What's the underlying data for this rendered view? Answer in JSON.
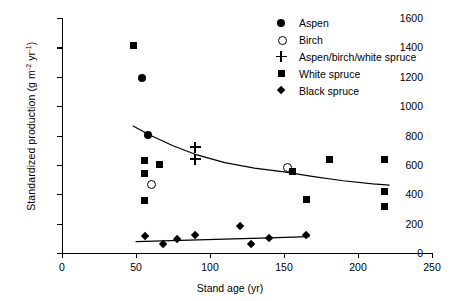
{
  "chart_data": {
    "type": "scatter",
    "title": "",
    "xlabel": "Stand age (yr)",
    "ylabel": "Standardized production (g m-2 yr-1)",
    "ylabel_parts": {
      "main": "Standardized production (g  m",
      "sup1": "-2",
      "mid": " yr",
      "sup2": "-1",
      "tail": ")"
    },
    "xlim": [
      0,
      250
    ],
    "ylim": [
      0,
      1600
    ],
    "xticks": [
      0,
      50,
      100,
      150,
      200,
      250
    ],
    "yticks": [
      0,
      200,
      400,
      600,
      800,
      1000,
      1200,
      1400,
      1600
    ],
    "grid": false,
    "legend_position": "top-right",
    "series": [
      {
        "name": "Aspen",
        "marker": "filled-circle",
        "points": [
          [
            54,
            1190
          ],
          [
            58,
            805
          ]
        ]
      },
      {
        "name": "Birch",
        "marker": "open-circle",
        "points": [
          [
            60,
            475
          ],
          [
            152,
            590
          ]
        ]
      },
      {
        "name": "Aspen/birch/white spruce",
        "marker": "plus",
        "points": [
          [
            90,
            720
          ],
          [
            90,
            640
          ]
        ]
      },
      {
        "name": "White spruce",
        "marker": "filled-square",
        "points": [
          [
            48,
            1415
          ],
          [
            56,
            630
          ],
          [
            56,
            540
          ],
          [
            56,
            355
          ],
          [
            66,
            600
          ],
          [
            156,
            555
          ],
          [
            165,
            365
          ],
          [
            181,
            635
          ],
          [
            218,
            640
          ],
          [
            218,
            420
          ],
          [
            218,
            315
          ]
        ]
      },
      {
        "name": "Black spruce",
        "marker": "filled-diamond",
        "points": [
          [
            56,
            115
          ],
          [
            68,
            60
          ],
          [
            78,
            95
          ],
          [
            90,
            125
          ],
          [
            120,
            185
          ],
          [
            128,
            60
          ],
          [
            140,
            100
          ],
          [
            165,
            120
          ]
        ]
      }
    ],
    "trend_lines": [
      {
        "name": "upper-trend",
        "points": [
          [
            48,
            865
          ],
          [
            60,
            800
          ],
          [
            75,
            730
          ],
          [
            90,
            672
          ],
          [
            110,
            615
          ],
          [
            130,
            578
          ],
          [
            150,
            552
          ],
          [
            170,
            520
          ],
          [
            190,
            492
          ],
          [
            210,
            470
          ],
          [
            221,
            462
          ]
        ]
      },
      {
        "name": "lower-trend",
        "points": [
          [
            50,
            78
          ],
          [
            80,
            86
          ],
          [
            110,
            94
          ],
          [
            140,
            103
          ],
          [
            167,
            112
          ]
        ]
      }
    ]
  },
  "legend": {
    "items": [
      {
        "label": "Aspen",
        "marker": "filled-circle"
      },
      {
        "label": "Birch",
        "marker": "open-circle"
      },
      {
        "label": "Aspen/birch/white spruce",
        "marker": "plus"
      },
      {
        "label": "White spruce",
        "marker": "filled-square"
      },
      {
        "label": "Black spruce",
        "marker": "filled-diamond"
      }
    ]
  },
  "colors": {
    "ink": "#000000",
    "background": "#ffffff"
  }
}
